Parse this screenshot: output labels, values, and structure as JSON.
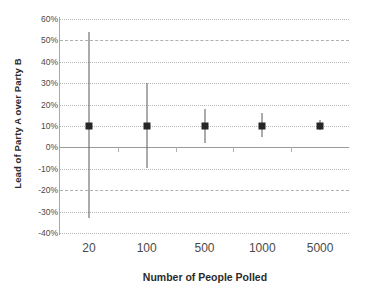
{
  "chart_data": {
    "type": "scatter",
    "title": "",
    "xlabel": "Number of People Polled",
    "ylabel": "Lead of Party A over Party B",
    "categories": [
      "20",
      "100",
      "500",
      "1000",
      "5000"
    ],
    "values": [
      10,
      10,
      10,
      10,
      10
    ],
    "error_low": [
      -33,
      -9.5,
      2,
      5,
      8
    ],
    "error_high": [
      54,
      30,
      18,
      16,
      13
    ],
    "ylim": [
      -40,
      60
    ],
    "ytick_labels": [
      "60%",
      "50%",
      "40%",
      "30%",
      "20%",
      "10%",
      "0%",
      "-10%",
      "-20%",
      "-30%",
      "-40%"
    ],
    "ytick_values": [
      60,
      50,
      40,
      30,
      20,
      10,
      0,
      -10,
      -20,
      -30,
      -40
    ],
    "grid": true,
    "legend": "none",
    "series": [
      {
        "name": "Poll result with margin of error",
        "points": [
          {
            "x": "20",
            "y": 10,
            "low": -33,
            "high": 54
          },
          {
            "x": "100",
            "y": 10,
            "low": -9.5,
            "high": 30
          },
          {
            "x": "500",
            "y": 10,
            "low": 2,
            "high": 18
          },
          {
            "x": "1000",
            "y": 10,
            "low": 5,
            "high": 16
          },
          {
            "x": "5000",
            "y": 10,
            "low": 8,
            "high": 13
          }
        ]
      }
    ],
    "colors": {
      "marker": "#262626",
      "errorbar": "#595959",
      "gridline": "#b9b9b9",
      "zeroline": "#9a9a9a",
      "axis": "#a8a8a8",
      "text": "#4a4a4a",
      "title_text": "#2b2b2b",
      "background": "#ffffff"
    }
  }
}
